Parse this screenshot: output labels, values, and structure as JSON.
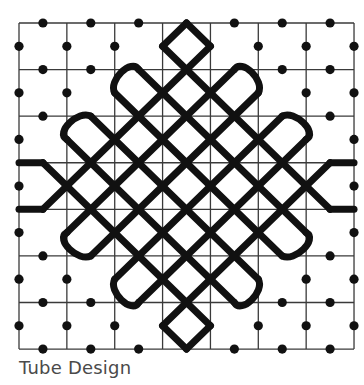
{
  "caption": "Tube Design",
  "colors": {
    "grid": "#3a3a3a",
    "line": "#111111",
    "dot": "#111111",
    "background": "#ffffff"
  },
  "grid": {
    "origin_x": 19,
    "origin_y": 23,
    "half_step_x": 23.93,
    "half_step_y": 23.29,
    "major_lines": [
      0,
      2,
      4,
      6,
      8,
      10,
      12,
      14
    ],
    "line_width": 1.3
  },
  "pattern": {
    "stroke_width": 7,
    "runs": [
      {
        "name": "slash-9",
        "from": [
          1,
          8
        ],
        "to": [
          8,
          1
        ]
      },
      {
        "name": "slash-11",
        "from": [
          2,
          9
        ],
        "to": [
          9,
          2
        ]
      },
      {
        "name": "slash-13",
        "from": [
          3,
          10
        ],
        "to": [
          10,
          3
        ]
      },
      {
        "name": "slash-15",
        "from": [
          4,
          11
        ],
        "to": [
          11,
          4
        ]
      },
      {
        "name": "slash-17",
        "from": [
          5,
          12
        ],
        "to": [
          12,
          5
        ]
      },
      {
        "name": "slash-19",
        "from": [
          6,
          13
        ],
        "to": [
          13,
          6
        ]
      },
      {
        "name": "backslash-m5",
        "from": [
          1,
          6
        ],
        "to": [
          8,
          13
        ]
      },
      {
        "name": "backslash-m3",
        "from": [
          2,
          5
        ],
        "to": [
          9,
          12
        ]
      },
      {
        "name": "backslash-m1",
        "from": [
          3,
          4
        ],
        "to": [
          10,
          11
        ]
      },
      {
        "name": "backslash-1",
        "from": [
          4,
          3
        ],
        "to": [
          11,
          10
        ]
      },
      {
        "name": "backslash-3",
        "from": [
          5,
          2
        ],
        "to": [
          12,
          9
        ]
      },
      {
        "name": "backslash-5",
        "from": [
          6,
          1
        ],
        "to": [
          13,
          8
        ]
      },
      {
        "name": "top-diamond-left",
        "from": [
          7,
          0
        ],
        "to": [
          6,
          1
        ]
      },
      {
        "name": "top-diamond-right",
        "from": [
          7,
          0
        ],
        "to": [
          8,
          1
        ]
      },
      {
        "name": "bottom-diamond-left",
        "from": [
          7,
          14
        ],
        "to": [
          6,
          13
        ]
      },
      {
        "name": "bottom-diamond-right",
        "from": [
          7,
          14
        ],
        "to": [
          8,
          13
        ]
      },
      {
        "name": "left-tube-upper",
        "from": [
          0,
          6
        ],
        "to": [
          1,
          6
        ]
      },
      {
        "name": "left-tube-lower",
        "from": [
          0,
          8
        ],
        "to": [
          1,
          8
        ]
      },
      {
        "name": "right-tube-upper",
        "from": [
          13,
          6
        ],
        "to": [
          14,
          6
        ]
      },
      {
        "name": "right-tube-lower",
        "from": [
          13,
          8
        ],
        "to": [
          14,
          8
        ]
      }
    ],
    "arcs": [
      {
        "name": "loop-upper-left-1",
        "from": [
          4,
          3
        ],
        "to": [
          5,
          2
        ]
      },
      {
        "name": "loop-upper-left-2",
        "from": [
          2,
          5
        ],
        "to": [
          3,
          4
        ]
      },
      {
        "name": "loop-upper-right-1",
        "from": [
          9,
          2
        ],
        "to": [
          10,
          3
        ]
      },
      {
        "name": "loop-upper-right-2",
        "from": [
          11,
          4
        ],
        "to": [
          12,
          5
        ]
      },
      {
        "name": "loop-lower-left-1",
        "from": [
          3,
          10
        ],
        "to": [
          2,
          9
        ]
      },
      {
        "name": "loop-lower-left-2",
        "from": [
          5,
          12
        ],
        "to": [
          4,
          11
        ]
      },
      {
        "name": "loop-lower-right-1",
        "from": [
          10,
          11
        ],
        "to": [
          9,
          12
        ]
      },
      {
        "name": "loop-lower-right-2",
        "from": [
          12,
          9
        ],
        "to": [
          11,
          10
        ]
      }
    ]
  },
  "dots": {
    "radius": 4.6,
    "points": [
      [
        1,
        0
      ],
      [
        3,
        0
      ],
      [
        5,
        0
      ],
      [
        9,
        0
      ],
      [
        11,
        0
      ],
      [
        13,
        0
      ],
      [
        0,
        1
      ],
      [
        2,
        1
      ],
      [
        4,
        1
      ],
      [
        10,
        1
      ],
      [
        12,
        1
      ],
      [
        14,
        1
      ],
      [
        1,
        2
      ],
      [
        3,
        2
      ],
      [
        11,
        2
      ],
      [
        13,
        2
      ],
      [
        0,
        3
      ],
      [
        2,
        3
      ],
      [
        12,
        3
      ],
      [
        14,
        3
      ],
      [
        1,
        4
      ],
      [
        13,
        4
      ],
      [
        0,
        5
      ],
      [
        14,
        5
      ],
      [
        0,
        7
      ],
      [
        14,
        7
      ],
      [
        0,
        9
      ],
      [
        14,
        9
      ],
      [
        1,
        10
      ],
      [
        13,
        10
      ],
      [
        0,
        11
      ],
      [
        2,
        11
      ],
      [
        12,
        11
      ],
      [
        14,
        11
      ],
      [
        1,
        12
      ],
      [
        3,
        12
      ],
      [
        11,
        12
      ],
      [
        13,
        12
      ],
      [
        0,
        13
      ],
      [
        2,
        13
      ],
      [
        4,
        13
      ],
      [
        10,
        13
      ],
      [
        12,
        13
      ],
      [
        14,
        13
      ],
      [
        1,
        14
      ],
      [
        3,
        14
      ],
      [
        5,
        14
      ],
      [
        9,
        14
      ],
      [
        11,
        14
      ],
      [
        13,
        14
      ]
    ]
  }
}
